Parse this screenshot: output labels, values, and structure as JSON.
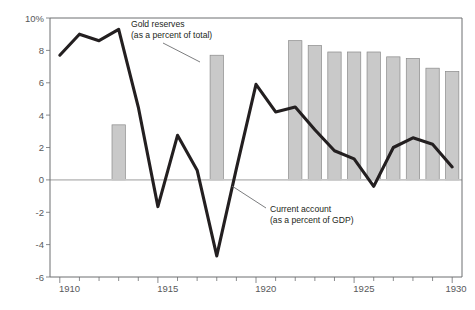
{
  "chart_data": {
    "type": "line",
    "title": "",
    "subtitle": "",
    "xlabel": "",
    "ylabel": "",
    "xlim": [
      1909.5,
      1930.5
    ],
    "ylim": [
      -6,
      10
    ],
    "grid": false,
    "legend_position": "inline-annotations",
    "x_ticks_major": [
      "1910",
      "1915",
      "1920",
      "1925",
      "1930"
    ],
    "x_ticks_major_values": [
      1910,
      1915,
      1920,
      1925,
      1930
    ],
    "x_ticks_minor_values": [
      1911,
      1912,
      1913,
      1914,
      1916,
      1917,
      1918,
      1919,
      1921,
      1922,
      1923,
      1924,
      1926,
      1927,
      1928,
      1929
    ],
    "y_ticks": [
      "10%",
      "8",
      "6",
      "4",
      "2",
      "0",
      "-2",
      "-4",
      "-6"
    ],
    "y_tick_values": [
      10,
      8,
      6,
      4,
      2,
      0,
      -2,
      -4,
      -6
    ],
    "zero_line": 0,
    "series": [
      {
        "name": "Gold reserves",
        "sublabel": "(as a percent of total)",
        "type": "bar",
        "unit": "percent of total",
        "color": "#c9c9c9",
        "edge_color": "#8a8a8a",
        "x": [
          1913,
          1918,
          1922,
          1923,
          1924,
          1925,
          1926,
          1927,
          1928,
          1929,
          1930
        ],
        "values": [
          3.4,
          7.7,
          8.6,
          8.3,
          7.9,
          7.9,
          7.9,
          7.6,
          7.5,
          6.9,
          6.7
        ]
      },
      {
        "name": "Current account",
        "sublabel": "(as a percent of GDP)",
        "type": "line",
        "unit": "percent of GDP",
        "color": "#231f20",
        "x": [
          1910,
          1911,
          1912,
          1913,
          1914,
          1915,
          1916,
          1917,
          1918,
          1919,
          1920,
          1921,
          1922,
          1923,
          1924,
          1925,
          1926,
          1927,
          1928,
          1929,
          1930
        ],
        "values": [
          7.7,
          9.0,
          8.6,
          9.3,
          4.5,
          -1.65,
          2.75,
          0.6,
          -4.7,
          0.7,
          5.9,
          4.2,
          4.5,
          3.1,
          1.8,
          1.3,
          -0.4,
          2.0,
          2.6,
          2.2,
          0.8
        ]
      }
    ],
    "annotations": [
      {
        "id": "gold-reserves-annotation",
        "line1": "Gold reserves",
        "line2": "(as a percent of total)",
        "points_to_year": 1918,
        "points_to_value": 6.4
      },
      {
        "id": "current-account-annotation",
        "line1": "Current account",
        "line2": "(as a percent of GDP)",
        "points_to_year": 1919,
        "points_to_value": 0.5
      }
    ]
  },
  "caption": {
    "partial_text": ""
  }
}
